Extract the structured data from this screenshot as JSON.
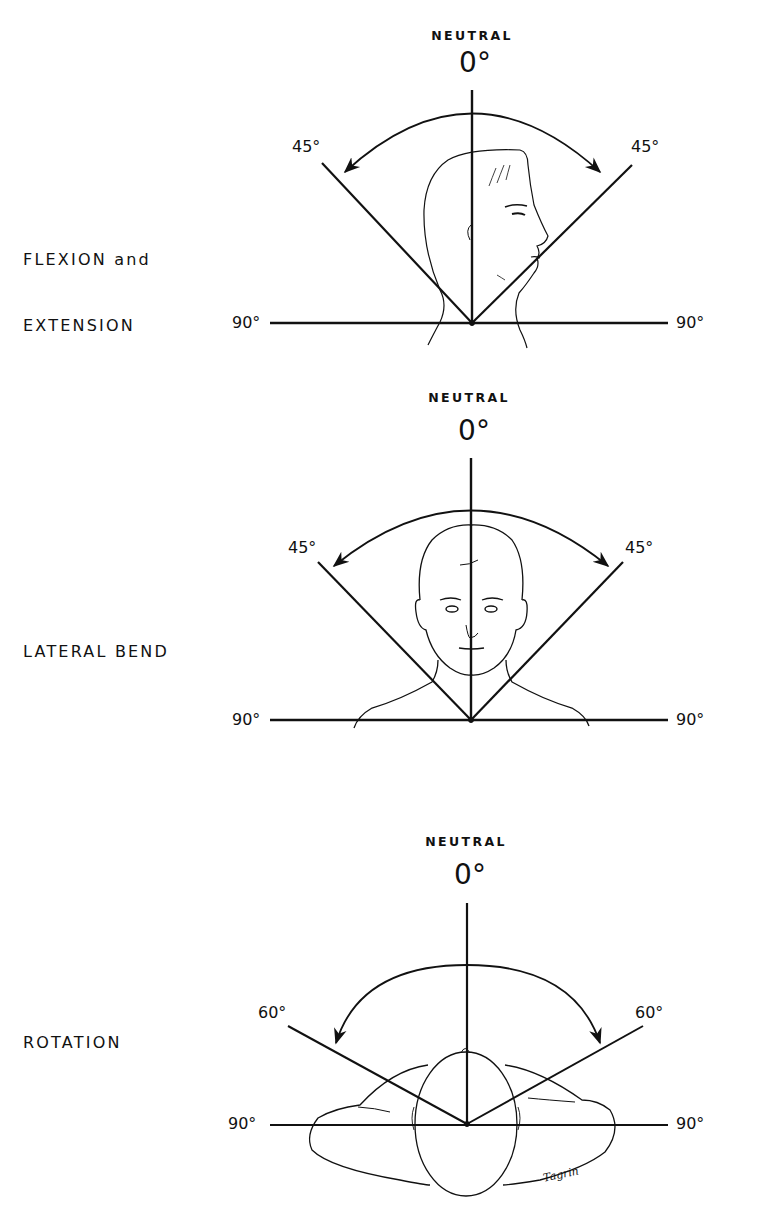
{
  "diagrams": [
    {
      "title_line1": "FLEXION and",
      "title_line2": "EXTENSION",
      "neutral_label": "NEUTRAL",
      "zero_label": "0°",
      "left_angle_label": "45°",
      "right_angle_label": "45°",
      "left_horizontal_label": "90°",
      "right_horizontal_label": "90°",
      "figure": "head-profile"
    },
    {
      "title_line1": "LATERAL BEND",
      "neutral_label": "NEUTRAL",
      "zero_label": "0°",
      "left_angle_label": "45°",
      "right_angle_label": "45°",
      "left_horizontal_label": "90°",
      "right_horizontal_label": "90°",
      "figure": "head-front"
    },
    {
      "title_line1": "ROTATION",
      "neutral_label": "NEUTRAL",
      "zero_label": "0°",
      "left_angle_label": "60°",
      "right_angle_label": "60°",
      "left_horizontal_label": "90°",
      "right_horizontal_label": "90°",
      "figure": "head-top"
    }
  ],
  "signature": "Tagrin",
  "colors": {
    "ink": "#111111",
    "background": "#ffffff"
  }
}
